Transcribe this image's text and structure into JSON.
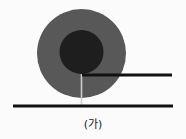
{
  "figure": {
    "caption": "(가)",
    "background_color": "#fbfbfb",
    "outer_disc": {
      "name": "outer-disc",
      "cx": 81.5,
      "cy": 53.5,
      "r": 44.5,
      "color": "#585858"
    },
    "inner_disc": {
      "name": "inner-disc",
      "cx": 81.5,
      "cy": 52.0,
      "r": 22.0,
      "color": "#1e1e1e"
    },
    "ground_line": {
      "name": "ground-line",
      "x1": 13,
      "y1": 106,
      "x2": 173,
      "y2": 106,
      "color": "#111111",
      "thickness": 3.2
    },
    "upper_line": {
      "name": "upper-line",
      "x1": 82,
      "y1": 75,
      "x2": 172,
      "y2": 75,
      "color": "#111111",
      "thickness": 3.0
    },
    "radius_line": {
      "name": "radius-line",
      "x1": 81.5,
      "y1": 74,
      "x2": 81.5,
      "y2": 106,
      "color": "#cfcfcf",
      "thickness": 1.6
    }
  }
}
